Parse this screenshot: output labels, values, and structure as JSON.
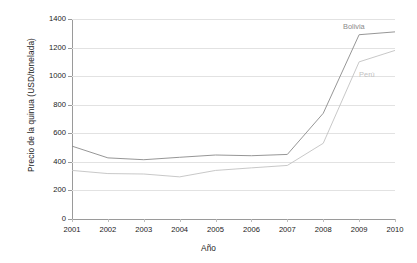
{
  "chart_data": {
    "type": "line",
    "title": "",
    "xlabel": "Año",
    "ylabel": "Precio de la quinua (USD/tonelada)",
    "categories": [
      "2001",
      "2002",
      "2003",
      "2004",
      "2005",
      "2006",
      "2007",
      "2008",
      "2009",
      "2010"
    ],
    "x": [
      2001,
      2002,
      2003,
      2004,
      2005,
      2006,
      2007,
      2008,
      2009,
      2010
    ],
    "xlim": [
      2001,
      2010
    ],
    "ylim": [
      0,
      1400
    ],
    "yticks": [
      0,
      200,
      400,
      600,
      800,
      1000,
      1200,
      1400
    ],
    "ytick_labels": [
      "0",
      "200",
      "400",
      "600",
      "800",
      "1000",
      "1200",
      "1400"
    ],
    "grid": true,
    "legend_position": "inline-annotation",
    "series": [
      {
        "name": "Bolivia",
        "color": "#8a8a8a",
        "label_x": 2008.55,
        "label_y": 1345,
        "values": [
          510,
          428,
          415,
          432,
          448,
          443,
          452,
          740,
          1290,
          1310
        ]
      },
      {
        "name": "Perú",
        "color": "#c2c2c2",
        "label_x": 2009.0,
        "label_y": 1010,
        "values": [
          340,
          318,
          315,
          295,
          340,
          358,
          375,
          530,
          1100,
          1180
        ]
      }
    ]
  },
  "colors": {
    "axis": "#9a9a9a",
    "grid": "#e2e2e2",
    "text": "#1a1a1a",
    "background": "#ffffff"
  }
}
